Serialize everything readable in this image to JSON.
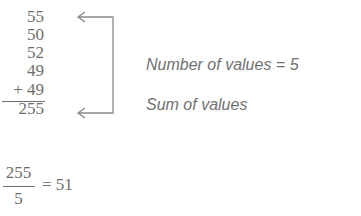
{
  "values": [
    "55",
    "50",
    "52",
    "49",
    "+ 49"
  ],
  "sum": "255",
  "labels": {
    "count": "Number of values = 5",
    "sum": "Sum of values"
  },
  "mean": {
    "numerator": "255",
    "denominator": "5",
    "equals": "= 51"
  },
  "colors": {
    "text": "#6e6e6e",
    "arrow": "#8a8a8a"
  }
}
